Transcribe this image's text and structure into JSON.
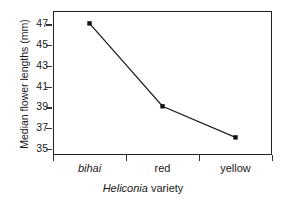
{
  "chart_data": {
    "type": "line",
    "title": "",
    "xlabel": "Heliconia variety",
    "xlabel_italic_part": "Heliconia",
    "xlabel_plain_part": " variety",
    "ylabel": "Median flower lengths (mm)",
    "categories": [
      "bihai",
      "red",
      "yellow"
    ],
    "categories_italic": [
      true,
      false,
      false
    ],
    "values": [
      47.1,
      39.1,
      36.1
    ],
    "xtick_labels": [
      "bihai",
      "red",
      "yellow"
    ],
    "ytick_labels": [
      "47",
      "45",
      "43",
      "41",
      "39",
      "37",
      "35"
    ],
    "ytick_values": [
      47,
      45,
      43,
      41,
      39,
      37,
      35
    ],
    "ylim": [
      34.4,
      48.3
    ],
    "grid": false,
    "legend": "none",
    "marker": "square",
    "line_color": "#222222",
    "marker_color": "#111111",
    "frame_color": "#222222",
    "background": "#ffffff"
  }
}
